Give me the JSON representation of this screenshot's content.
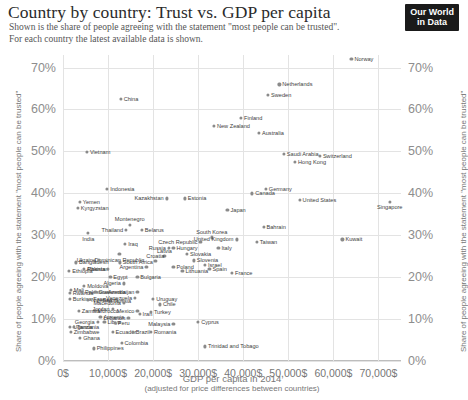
{
  "header": {
    "title": "Country by country: Trust vs. GDP per capita",
    "subtitle_line1": "Shown is the share of people agreeing with the statement \"most people can be trusted\".",
    "subtitle_line2": "For each country the latest available data is shown.",
    "logo_line1": "Our World",
    "logo_line2": "in Data"
  },
  "chart_data": {
    "type": "scatter",
    "title": "Country by country: Trust vs. GDP per capita",
    "subtitle": "Shown is the share of people agreeing with the statement \"most people can be trusted\". For each country the latest available data is shown.",
    "xlabel": "GDP per capita in 2014",
    "xlabel_sub": "(adjusted for price differences between countries)",
    "ylabel": "Share of people agreeing with the statement \"most people can be trusted\"",
    "xlim": [
      0,
      75000
    ],
    "ylim": [
      0,
      73
    ],
    "grid": true,
    "legend": "none",
    "point_color": "#8a8a8a",
    "grid_color": "#e3e3e3",
    "xticks": [
      0,
      10000,
      20000,
      30000,
      40000,
      50000,
      60000,
      70000
    ],
    "xticklabels": [
      "0$",
      "10,000$",
      "20,000$",
      "30,000$",
      "40,000$",
      "50,000$",
      "60,000$",
      "70,000$"
    ],
    "yticks": [
      0,
      10,
      20,
      30,
      40,
      50,
      60,
      70
    ],
    "yticklabels": [
      "0%",
      "10%",
      "20%",
      "30%",
      "40%",
      "50%",
      "60%",
      "70%"
    ],
    "points": [
      {
        "name": "Norway",
        "x": 64000,
        "y": 72.0,
        "pos": "r"
      },
      {
        "name": "Netherlands",
        "x": 48000,
        "y": 66.0,
        "pos": "r"
      },
      {
        "name": "Sweden",
        "x": 45500,
        "y": 63.5,
        "pos": "r"
      },
      {
        "name": "Finland",
        "x": 39500,
        "y": 58.0,
        "pos": "r"
      },
      {
        "name": "New Zealand",
        "x": 33500,
        "y": 56.0,
        "pos": "r"
      },
      {
        "name": "Australia",
        "x": 43500,
        "y": 54.5,
        "pos": "r"
      },
      {
        "name": "China",
        "x": 12800,
        "y": 62.5,
        "pos": "r"
      },
      {
        "name": "Vietnam",
        "x": 5300,
        "y": 49.8,
        "pos": "r"
      },
      {
        "name": "Saudi Arabia",
        "x": 49000,
        "y": 49.5,
        "pos": "r"
      },
      {
        "name": "Switzerland",
        "x": 57000,
        "y": 49.0,
        "pos": "r"
      },
      {
        "name": "Hong Kong",
        "x": 51500,
        "y": 47.5,
        "pos": "r"
      },
      {
        "name": "Indonesia",
        "x": 9800,
        "y": 41.0,
        "pos": "r"
      },
      {
        "name": "Germany",
        "x": 45000,
        "y": 41.0,
        "pos": "r"
      },
      {
        "name": "Canada",
        "x": 42000,
        "y": 40.0,
        "pos": "r"
      },
      {
        "name": "Kazakhstan",
        "x": 23000,
        "y": 38.8,
        "pos": "l"
      },
      {
        "name": "Estonia",
        "x": 27000,
        "y": 38.8,
        "pos": "r"
      },
      {
        "name": "United States",
        "x": 52500,
        "y": 38.5,
        "pos": "r"
      },
      {
        "name": "Yemen",
        "x": 3700,
        "y": 38.0,
        "pos": "r"
      },
      {
        "name": "Singapore",
        "x": 72500,
        "y": 38.0,
        "pos": "b"
      },
      {
        "name": "Kyrgyzstan",
        "x": 3300,
        "y": 36.5,
        "pos": "r"
      },
      {
        "name": "Japan",
        "x": 36500,
        "y": 36.0,
        "pos": "r"
      },
      {
        "name": "Montenegro",
        "x": 14800,
        "y": 32.5,
        "pos": "t"
      },
      {
        "name": "Belarus",
        "x": 17500,
        "y": 31.3,
        "pos": "r"
      },
      {
        "name": "Bahrain",
        "x": 44500,
        "y": 32.0,
        "pos": "r"
      },
      {
        "name": "India",
        "x": 5600,
        "y": 30.5,
        "pos": "b"
      },
      {
        "name": "Thailand",
        "x": 14000,
        "y": 31.3,
        "pos": "l"
      },
      {
        "name": "South Korea",
        "x": 33000,
        "y": 29.5,
        "pos": "t"
      },
      {
        "name": "United Kingdom",
        "x": 38500,
        "y": 29.0,
        "pos": "l"
      },
      {
        "name": "Taiwan",
        "x": 43000,
        "y": 28.5,
        "pos": "r"
      },
      {
        "name": "Czech Republic",
        "x": 30500,
        "y": 28.5,
        "pos": "l"
      },
      {
        "name": "Kuwait",
        "x": 62000,
        "y": 29.0,
        "pos": "r"
      },
      {
        "name": "Iraq",
        "x": 13800,
        "y": 28.0,
        "pos": "r"
      },
      {
        "name": "Russia",
        "x": 23500,
        "y": 27.0,
        "pos": "l"
      },
      {
        "name": "Hungary",
        "x": 24500,
        "y": 27.0,
        "pos": "r"
      },
      {
        "name": "Italy",
        "x": 34500,
        "y": 27.0,
        "pos": "r"
      },
      {
        "name": "Slovakia",
        "x": 27500,
        "y": 25.5,
        "pos": "r"
      },
      {
        "name": "Latvia",
        "x": 22500,
        "y": 25.0,
        "pos": "t"
      },
      {
        "name": "Dominican Republic",
        "x": 12500,
        "y": 25.5,
        "pos": "b"
      },
      {
        "name": "Bangladesh",
        "x": 2900,
        "y": 23.5,
        "pos": "r"
      },
      {
        "name": "Ukraine",
        "x": 8000,
        "y": 24.0,
        "pos": "l"
      },
      {
        "name": "South Africa",
        "x": 12600,
        "y": 23.5,
        "pos": "r"
      },
      {
        "name": "Croatia",
        "x": 20500,
        "y": 23.8,
        "pos": "t"
      },
      {
        "name": "Slovenia",
        "x": 29000,
        "y": 24.0,
        "pos": "r"
      },
      {
        "name": "Israel",
        "x": 31500,
        "y": 23.0,
        "pos": "r"
      },
      {
        "name": "Spain",
        "x": 32500,
        "y": 22.0,
        "pos": "r"
      },
      {
        "name": "France",
        "x": 37500,
        "y": 21.0,
        "pos": "r"
      },
      {
        "name": "Poland",
        "x": 24500,
        "y": 22.5,
        "pos": "r"
      },
      {
        "name": "Argentina",
        "x": 18500,
        "y": 22.5,
        "pos": "l"
      },
      {
        "name": "Lithuania",
        "x": 26500,
        "y": 21.5,
        "pos": "r"
      },
      {
        "name": "Ethiopia",
        "x": 1400,
        "y": 21.5,
        "pos": "r"
      },
      {
        "name": "Pakistan",
        "x": 4700,
        "y": 22.0,
        "pos": "r"
      },
      {
        "name": "Albania",
        "x": 10000,
        "y": 22.0,
        "pos": "l"
      },
      {
        "name": "Egypt",
        "x": 10500,
        "y": 20.0,
        "pos": "r"
      },
      {
        "name": "Bulgaria",
        "x": 16500,
        "y": 20.0,
        "pos": "r"
      },
      {
        "name": "Algeria",
        "x": 13500,
        "y": 18.5,
        "pos": "l"
      },
      {
        "name": "Moldova",
        "x": 4700,
        "y": 18.0,
        "pos": "r"
      },
      {
        "name": "Mali",
        "x": 1700,
        "y": 17.0,
        "pos": "r"
      },
      {
        "name": "Rwanda",
        "x": 1500,
        "y": 16.2,
        "pos": "r"
      },
      {
        "name": "Palestine",
        "x": 4200,
        "y": 16.5,
        "pos": "r"
      },
      {
        "name": "Guatemala",
        "x": 7200,
        "y": 16.5,
        "pos": "r"
      },
      {
        "name": "Azerbaijan",
        "x": 16500,
        "y": 16.5,
        "pos": "l"
      },
      {
        "name": "Venezuela",
        "x": 16000,
        "y": 15.0,
        "pos": "l"
      },
      {
        "name": "Burkina Faso",
        "x": 1500,
        "y": 14.8,
        "pos": "r"
      },
      {
        "name": "Nigeria",
        "x": 5600,
        "y": 14.5,
        "pos": "r"
      },
      {
        "name": "Tunisia",
        "x": 10500,
        "y": 14.3,
        "pos": "r"
      },
      {
        "name": "Serbia",
        "x": 13000,
        "y": 14.5,
        "pos": "l"
      },
      {
        "name": "Macedonia",
        "x": 13500,
        "y": 13.8,
        "pos": "l"
      },
      {
        "name": "Uruguay",
        "x": 20000,
        "y": 14.8,
        "pos": "r"
      },
      {
        "name": "Chile",
        "x": 21500,
        "y": 13.5,
        "pos": "r"
      },
      {
        "name": "Zambia",
        "x": 3500,
        "y": 12.0,
        "pos": "r"
      },
      {
        "name": "Morocco",
        "x": 7000,
        "y": 12.0,
        "pos": "r"
      },
      {
        "name": "Jordan",
        "x": 11000,
        "y": 12.5,
        "pos": "l"
      },
      {
        "name": "Mexico",
        "x": 16500,
        "y": 12.0,
        "pos": "l"
      },
      {
        "name": "Iran",
        "x": 17000,
        "y": 11.3,
        "pos": "r"
      },
      {
        "name": "Turkey",
        "x": 19500,
        "y": 11.8,
        "pos": "r"
      },
      {
        "name": "Armenia",
        "x": 8300,
        "y": 10.5,
        "pos": "r"
      },
      {
        "name": "Lebanon",
        "x": 14500,
        "y": 10.2,
        "pos": "l"
      },
      {
        "name": "Georgia",
        "x": 7700,
        "y": 9.3,
        "pos": "l"
      },
      {
        "name": "Libya",
        "x": 9200,
        "y": 9.3,
        "pos": "r"
      },
      {
        "name": "Peru",
        "x": 11500,
        "y": 9.0,
        "pos": "r"
      },
      {
        "name": "Malaysia",
        "x": 24500,
        "y": 8.8,
        "pos": "l"
      },
      {
        "name": "Cyprus",
        "x": 30000,
        "y": 9.3,
        "pos": "r"
      },
      {
        "name": "Uganda",
        "x": 1600,
        "y": 8.2,
        "pos": "r"
      },
      {
        "name": "Tanzania",
        "x": 2400,
        "y": 8.2,
        "pos": "r"
      },
      {
        "name": "Zimbabwe",
        "x": 1700,
        "y": 7.0,
        "pos": "r"
      },
      {
        "name": "Ecuador",
        "x": 11000,
        "y": 7.0,
        "pos": "r"
      },
      {
        "name": "Brazil",
        "x": 15500,
        "y": 7.0,
        "pos": "r"
      },
      {
        "name": "Romania",
        "x": 19500,
        "y": 7.0,
        "pos": "r"
      },
      {
        "name": "Ghana",
        "x": 3800,
        "y": 5.5,
        "pos": "r"
      },
      {
        "name": "Colombia",
        "x": 13000,
        "y": 4.3,
        "pos": "r"
      },
      {
        "name": "Philippines",
        "x": 6800,
        "y": 3.0,
        "pos": "r"
      },
      {
        "name": "Trinidad and Tobago",
        "x": 31500,
        "y": 3.5,
        "pos": "r"
      }
    ]
  }
}
